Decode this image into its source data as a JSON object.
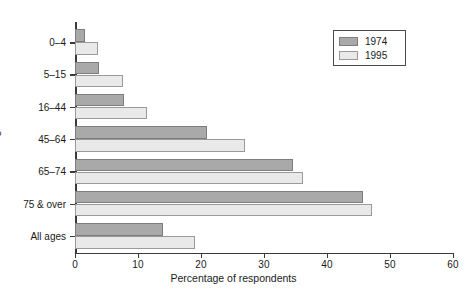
{
  "chart_data": {
    "type": "bar",
    "orientation": "horizontal",
    "title": "",
    "xlabel": "Percentage of respondents",
    "ylabel": "Age",
    "xlim": [
      0,
      60
    ],
    "xticks": [
      0,
      10,
      20,
      30,
      40,
      50,
      60
    ],
    "xtick_labels": [
      "0",
      "10",
      "20",
      "30",
      "40",
      "50",
      "60"
    ],
    "grid": false,
    "legend_position": "top-right",
    "categories": [
      "0–4",
      "5–15",
      "16–44",
      "45–64",
      "65–74",
      "75 & over",
      "All ages"
    ],
    "series": [
      {
        "name": "1974",
        "color": "#a9a9a9",
        "values": [
          1.6,
          3.8,
          7.8,
          21.0,
          34.6,
          45.7,
          14.0
        ]
      },
      {
        "name": "1995",
        "color": "#e9e9e9",
        "values": [
          3.7,
          7.6,
          11.4,
          27.0,
          36.2,
          47.2,
          19.0
        ]
      }
    ]
  },
  "legend": {
    "entries": [
      {
        "label": "1974",
        "swatch": "#a9a9a9"
      },
      {
        "label": "1995",
        "swatch": "#e9e9e9"
      }
    ]
  },
  "axis": {
    "x_title": "Percentage of respondents",
    "y_title": "Age"
  },
  "page": {
    "caption_fragment": ""
  }
}
